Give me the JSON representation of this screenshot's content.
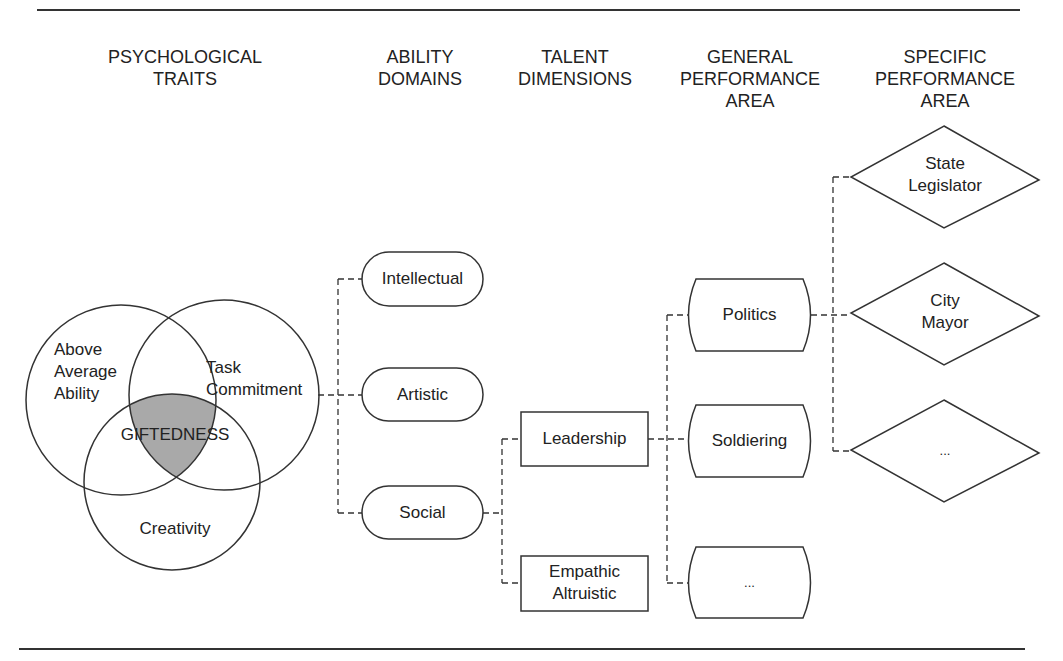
{
  "headers": [
    {
      "id": "psychological-traits",
      "text": "PSYCHOLOGICAL\nTRAITS"
    },
    {
      "id": "ability-domains",
      "text": "ABILITY\nDOMAINS"
    },
    {
      "id": "talent-dimensions",
      "text": "TALENT\nDIMENSIONS"
    },
    {
      "id": "general-performance-area",
      "text": "GENERAL\nPERFORMANCE\nAREA"
    },
    {
      "id": "specific-performance-area",
      "text": "SPECIFIC\nPERFORMANCE\nAREA"
    }
  ],
  "venn": {
    "circles": [
      "Above\nAverage\nAbility",
      "Task\nCommitment",
      "Creativity"
    ],
    "intersection": "GIFTEDNESS",
    "intersection_fill": "#a9a9a9"
  },
  "ability_domains": [
    "Intellectual",
    "Artistic",
    "Social"
  ],
  "talent_dimensions": [
    "Leadership",
    "Empathic\nAltruistic"
  ],
  "general_performance_areas": [
    "Politics",
    "Soldiering",
    "..."
  ],
  "specific_performance_areas": [
    "State\nLegislator",
    "City\nMayor",
    "..."
  ],
  "colors": {
    "stroke": "#333333",
    "shade": "#a9a9a9",
    "background": "#ffffff"
  }
}
